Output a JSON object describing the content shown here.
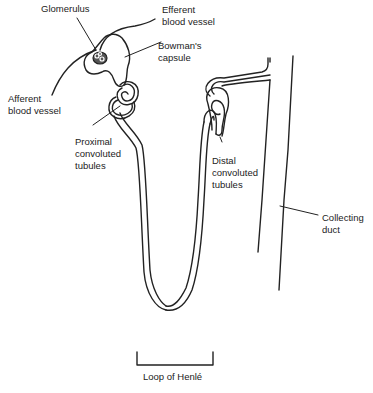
{
  "diagram": {
    "stroke_color": "#222222",
    "background": "#ffffff",
    "labels": {
      "glomerulus": {
        "lines": [
          "Glomerulus"
        ]
      },
      "efferent": {
        "lines": [
          "Efferent",
          "blood vessel"
        ]
      },
      "bowmans": {
        "lines": [
          "Bowman's",
          "capsule"
        ]
      },
      "afferent": {
        "lines": [
          "Afferent",
          "blood vessel"
        ]
      },
      "proximal": {
        "lines": [
          "Proximal",
          "convoluted",
          "tubules"
        ]
      },
      "distal": {
        "lines": [
          "Distal",
          "convoluted",
          "tubules"
        ]
      },
      "collecting": {
        "lines": [
          "Collecting",
          "duct"
        ]
      },
      "loop": {
        "lines": [
          "Loop of Henlé"
        ]
      }
    }
  }
}
